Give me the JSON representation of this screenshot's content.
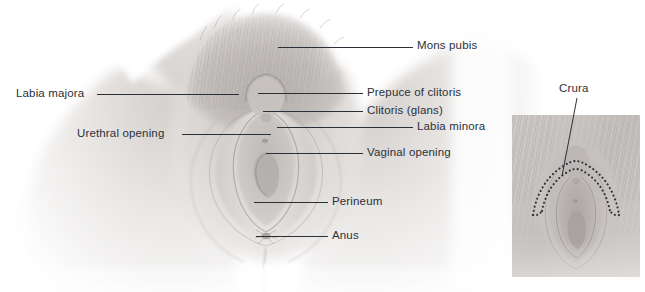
{
  "figure": {
    "width": 645,
    "height": 292,
    "background_color": "#ffffff",
    "label_text_color": "#2b3139",
    "leader_line_color": "#2a3038",
    "skin_light": "#f3f1ef",
    "skin_mid": "#d8d4d1",
    "skin_shadow": "#b9b4b1",
    "hair_tone": "#b0aca9",
    "inset_panel_tone": "#c9c5c2",
    "crura_dot_color": "#2b3139"
  },
  "main_view": {
    "name": "anterior-vulva-view",
    "labels": [
      {
        "id": "mons-pubis",
        "text": "Mons pubis",
        "side": "right",
        "text_x": 417,
        "text_y": 39,
        "leader_x": 278,
        "leader_y": 47,
        "leader_width": 135
      },
      {
        "id": "labia-majora",
        "text": "Labia majora",
        "side": "left",
        "text_x": 16,
        "text_y": 87,
        "leader_x": 97,
        "leader_y": 94,
        "leader_width": 142
      },
      {
        "id": "prepuce-of-clitoris",
        "text": "Prepuce of clitoris",
        "side": "right",
        "text_x": 367,
        "text_y": 86,
        "leader_x": 258,
        "leader_y": 93,
        "leader_width": 105
      },
      {
        "id": "clitoris-glans",
        "text": "Clitoris (glans)",
        "side": "right",
        "text_x": 367,
        "text_y": 104,
        "leader_x": 263,
        "leader_y": 111,
        "leader_width": 100
      },
      {
        "id": "labia-minora",
        "text": "Labia minora",
        "side": "right",
        "text_x": 417,
        "text_y": 120,
        "leader_x": 277,
        "leader_y": 127,
        "leader_width": 136
      },
      {
        "id": "urethral-opening",
        "text": "Urethral opening",
        "side": "left",
        "text_x": 77,
        "text_y": 127,
        "leader_x": 182,
        "leader_y": 134,
        "leader_width": 89
      },
      {
        "id": "vaginal-opening",
        "text": "Vaginal opening",
        "side": "right",
        "text_x": 367,
        "text_y": 146,
        "leader_x": 266,
        "leader_y": 153,
        "leader_width": 97
      },
      {
        "id": "perineum",
        "text": "Perineum",
        "side": "right",
        "text_x": 332,
        "text_y": 195,
        "leader_x": 254,
        "leader_y": 202,
        "leader_width": 74
      },
      {
        "id": "anus",
        "text": "Anus",
        "side": "right",
        "text_x": 332,
        "text_y": 229,
        "leader_x": 256,
        "leader_y": 236,
        "leader_width": 72
      }
    ]
  },
  "inset_view": {
    "name": "crura-inset-view",
    "panel": {
      "x": 512,
      "y": 115,
      "width": 128,
      "height": 162
    },
    "label": {
      "id": "crura",
      "text": "Crura",
      "text_x": 559,
      "text_y": 82,
      "leader_from_x": 577,
      "leader_from_y": 98,
      "leader_to_x": 562,
      "leader_to_y": 176
    }
  }
}
